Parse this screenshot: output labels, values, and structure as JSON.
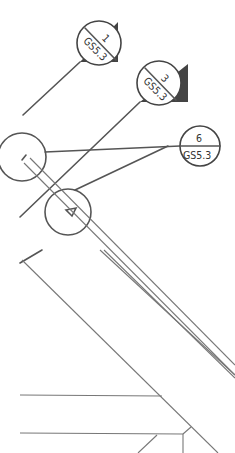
{
  "drawing": {
    "type": "technical-detail-callouts",
    "callouts": [
      {
        "number": "1",
        "sheet": "GS5.3"
      },
      {
        "number": "3",
        "sheet": "GS5.3"
      },
      {
        "number": "6",
        "sheet": "GS5.3"
      }
    ]
  },
  "colors": {
    "line": "#555555",
    "background": "#ffffff"
  }
}
